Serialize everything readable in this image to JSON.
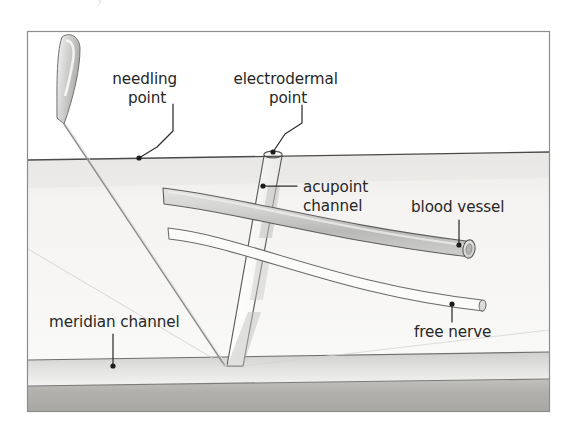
{
  "figure": {
    "title_cropped": "y",
    "frame": {
      "x": 27,
      "y": 31,
      "width": 523,
      "height": 381
    }
  },
  "labels": [
    {
      "id": "needling-point",
      "lines": [
        "needling",
        "point"
      ],
      "text_anchor": "middle",
      "x": 147,
      "y": 84,
      "line_height": 19,
      "leader": "M 173 104 L 173 131 L 157 147 L 139 158",
      "dot": {
        "x": 139,
        "y": 158
      }
    },
    {
      "id": "electrodermal-point",
      "lines": [
        "electrodermal",
        "point"
      ],
      "text_anchor": "middle",
      "x": 288,
      "y": 84,
      "line_height": 19,
      "leader": "M 302 105 L 302 123 L 285 134 L 273 152",
      "dot": {
        "x": 273,
        "y": 152
      }
    },
    {
      "id": "acupoint-channel",
      "lines": [
        "acupoint",
        "channel"
      ],
      "text_anchor": "start",
      "x": 303,
      "y": 192,
      "line_height": 19,
      "leader": "M 297 186 L 263 186",
      "dot": {
        "x": 263,
        "y": 186
      }
    },
    {
      "id": "blood-vessel",
      "lines": [
        "blood vessel"
      ],
      "text_anchor": "start",
      "x": 411,
      "y": 212,
      "line_height": 19,
      "leader": "M 459 220 L 459 245",
      "dot": {
        "x": 459,
        "y": 245
      }
    },
    {
      "id": "meridian-channel",
      "lines": [
        "meridian channel"
      ],
      "text_anchor": "start",
      "x": 49,
      "y": 327,
      "line_height": 19,
      "leader": "M 113 334 L 113 366",
      "dot": {
        "x": 113,
        "y": 366
      }
    },
    {
      "id": "free-nerve",
      "lines": [
        "free nerve"
      ],
      "text_anchor": "start",
      "x": 414,
      "y": 337,
      "line_height": 19,
      "leader": "M 452 322 L 452 304",
      "dot": {
        "x": 452,
        "y": 304
      }
    }
  ],
  "anatomy": {
    "skin_surface_label": "skin-surface-line",
    "tissue_label": "subcutaneous-tissue",
    "meridian_band_label": "meridian-channel-band",
    "muscle_band_label": "deep-muscle-layer",
    "needle_label": "acupuncture-needle",
    "acupoint_column_label": "acupoint-channel-column",
    "vessel_label": "blood-vessel-tube",
    "nerve_label": "free-nerve-fiber"
  },
  "colors": {
    "frame_stroke": "#8d8d8d",
    "line_stroke": "#4a4a4a",
    "label_text": "#262626",
    "tissue_fill": "#f2f1ef",
    "meridian_band": "#c9c9c7",
    "muscle_band": "#b6b5b2",
    "vessel_fill": "#cdcdcb",
    "channel_fill": "#fbfbfa",
    "needle_fill": "#d5d5d3",
    "page_background": "#ffffff"
  }
}
